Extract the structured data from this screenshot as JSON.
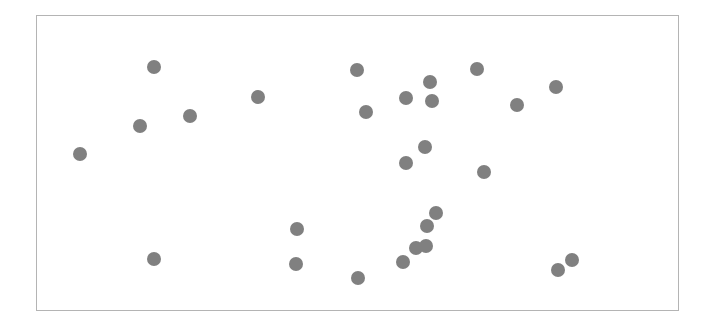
{
  "chart_data": {
    "type": "scatter",
    "title": "",
    "xlabel": "",
    "ylabel": "",
    "xlim": [
      0,
      100
    ],
    "ylim": [
      0,
      100
    ],
    "grid": false,
    "legend": null,
    "axes_visible": false,
    "frame": true,
    "marker_color": "#808080",
    "marker_size_px": 14,
    "series": [
      {
        "name": "points",
        "points": [
          {
            "x": 6.7,
            "y": 53.0
          },
          {
            "x": 16.0,
            "y": 62.5
          },
          {
            "x": 18.3,
            "y": 82.8
          },
          {
            "x": 18.2,
            "y": 17.2
          },
          {
            "x": 23.8,
            "y": 65.9
          },
          {
            "x": 34.4,
            "y": 72.3
          },
          {
            "x": 40.5,
            "y": 27.7
          },
          {
            "x": 40.4,
            "y": 15.5
          },
          {
            "x": 49.9,
            "y": 81.8
          },
          {
            "x": 51.3,
            "y": 67.2
          },
          {
            "x": 50.1,
            "y": 10.8
          },
          {
            "x": 57.5,
            "y": 72.0
          },
          {
            "x": 57.5,
            "y": 50.0
          },
          {
            "x": 57.1,
            "y": 16.2
          },
          {
            "x": 59.1,
            "y": 21.0
          },
          {
            "x": 60.6,
            "y": 55.4
          },
          {
            "x": 60.7,
            "y": 21.6
          },
          {
            "x": 60.9,
            "y": 28.7
          },
          {
            "x": 61.3,
            "y": 77.7
          },
          {
            "x": 61.6,
            "y": 71.0
          },
          {
            "x": 62.2,
            "y": 33.1
          },
          {
            "x": 68.7,
            "y": 82.1
          },
          {
            "x": 69.7,
            "y": 47.0
          },
          {
            "x": 74.9,
            "y": 69.6
          },
          {
            "x": 80.9,
            "y": 75.7
          },
          {
            "x": 81.3,
            "y": 13.5
          },
          {
            "x": 83.4,
            "y": 16.9
          }
        ]
      }
    ]
  }
}
